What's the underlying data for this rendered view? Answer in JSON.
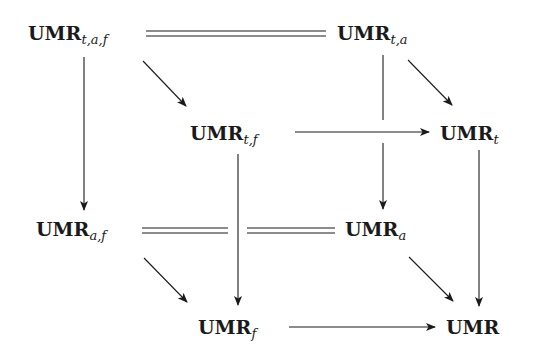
{
  "diagram": {
    "type": "commutative-cube",
    "nodes": [
      {
        "id": "taf",
        "base": "UMR",
        "sub": "t,a,f",
        "x": 28,
        "y": 24
      },
      {
        "id": "ta",
        "base": "UMR",
        "sub": "t,a",
        "x": 337,
        "y": 24
      },
      {
        "id": "tf",
        "base": "UMR",
        "sub": "t,f",
        "x": 190,
        "y": 124
      },
      {
        "id": "t",
        "base": "UMR",
        "sub": "t",
        "x": 440,
        "y": 124
      },
      {
        "id": "af",
        "base": "UMR",
        "sub": "a,f",
        "x": 36,
        "y": 220
      },
      {
        "id": "a",
        "base": "UMR",
        "sub": "a",
        "x": 345,
        "y": 220
      },
      {
        "id": "f",
        "base": "UMR",
        "sub": "f",
        "x": 198,
        "y": 318
      },
      {
        "id": "base",
        "base": "UMR",
        "sub": "",
        "x": 446,
        "y": 318
      }
    ],
    "edges": [
      {
        "from": "taf",
        "to": "ta",
        "style": "double"
      },
      {
        "from": "af",
        "to": "a",
        "style": "double"
      },
      {
        "from": "taf",
        "to": "tf",
        "style": "arrow"
      },
      {
        "from": "ta",
        "to": "t",
        "style": "arrow"
      },
      {
        "from": "af",
        "to": "f",
        "style": "arrow"
      },
      {
        "from": "a",
        "to": "base",
        "style": "arrow"
      },
      {
        "from": "taf",
        "to": "af",
        "style": "arrow"
      },
      {
        "from": "ta",
        "to": "a",
        "style": "arrow"
      },
      {
        "from": "tf",
        "to": "f",
        "style": "arrow"
      },
      {
        "from": "t",
        "to": "base",
        "style": "arrow"
      },
      {
        "from": "tf",
        "to": "t",
        "style": "arrow"
      },
      {
        "from": "f",
        "to": "base",
        "style": "arrow"
      }
    ]
  },
  "labels": {
    "taf": {
      "base": "UMR",
      "sub": "t,a,f"
    },
    "ta": {
      "base": "UMR",
      "sub": "t,a"
    },
    "tf": {
      "base": "UMR",
      "sub": "t,f"
    },
    "t": {
      "base": "UMR",
      "sub": "t"
    },
    "af": {
      "base": "UMR",
      "sub": "a,f"
    },
    "a": {
      "base": "UMR",
      "sub": "a"
    },
    "f": {
      "base": "UMR",
      "sub": "f"
    },
    "base": {
      "base": "UMR",
      "sub": ""
    }
  },
  "colors": {
    "ink": "#1a1a1a",
    "background": "#ffffff"
  }
}
